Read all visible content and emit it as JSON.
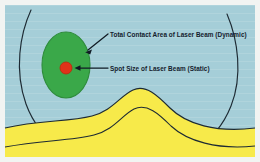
{
  "figure": {
    "background_color": "#a5ced8",
    "frame_color": "#f2f4f2"
  },
  "annotations": [
    {
      "id": "dynamic",
      "text": "Total Contact Area of Laser Beam (Dynamic)",
      "points_to": "green-ellipse",
      "arrow": "diagonal-down-left"
    },
    {
      "id": "static",
      "text": "Spot Size of Laser Beam (Static)",
      "points_to": "red-dot",
      "arrow": "horizontal-left"
    }
  ],
  "shapes": {
    "bowl_outline": {
      "name": "tooth-cavity-outline",
      "stroke": "#1d2a33",
      "fill": "none"
    },
    "green_ellipse": {
      "name": "total-contact-area",
      "fill": "#3aa849",
      "stroke": "#2b7a36",
      "cx": 66,
      "cy": 65,
      "rx": 24,
      "ry": 33
    },
    "red_dot": {
      "name": "laser-spot",
      "fill": "#e03219",
      "stroke": "#b52a12",
      "cx": 66,
      "cy": 68,
      "r": 6
    },
    "yellow_wave": {
      "name": "dentin-layer",
      "fill": "#f7ea4a",
      "stroke": "#1d2a33"
    }
  },
  "colors": {
    "background": "#a5ced8",
    "green": "#3aa849",
    "red": "#e03219",
    "yellow": "#f7ea4a",
    "outline": "#1d2a33",
    "text": "#14202c"
  }
}
